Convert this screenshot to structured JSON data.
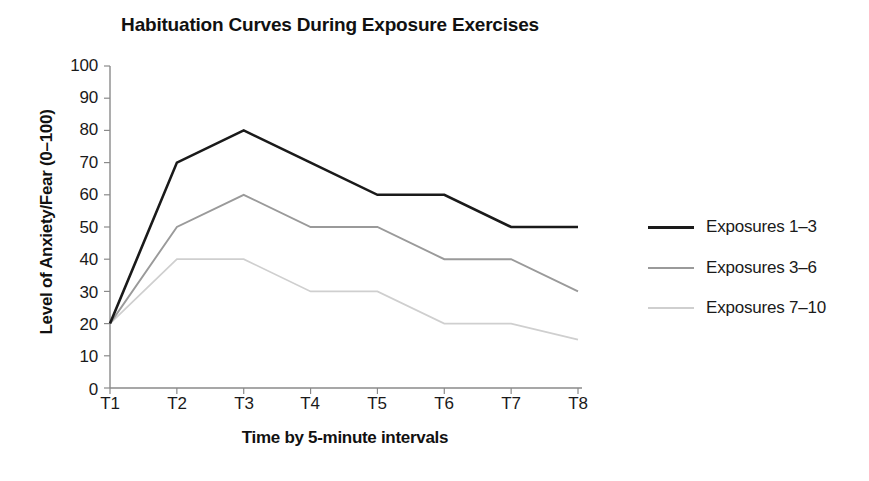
{
  "chart_data": {
    "type": "line",
    "title": "Habituation Curves During Exposure Exercises",
    "xlabel": "Time by 5-minute intervals",
    "ylabel": "Level of Anxiety/Fear (0–100)",
    "categories": [
      "T1",
      "T2",
      "T3",
      "T4",
      "T5",
      "T6",
      "T7",
      "T8"
    ],
    "ylim": [
      0,
      100
    ],
    "yticks": [
      "0",
      "10",
      "20",
      "30",
      "40",
      "50",
      "60",
      "70",
      "80",
      "90",
      "100"
    ],
    "grid": false,
    "legend_position": "right",
    "series": [
      {
        "name": "Exposures 1–3",
        "color": "#1a1a1a",
        "width": 2.6,
        "values": [
          20,
          70,
          80,
          70,
          60,
          60,
          50,
          50
        ]
      },
      {
        "name": "Exposures 3–6",
        "color": "#9a9a9a",
        "width": 1.9,
        "values": [
          20,
          50,
          60,
          50,
          50,
          40,
          40,
          30
        ]
      },
      {
        "name": "Exposures 7–10",
        "color": "#cfcfcf",
        "width": 1.7,
        "values": [
          20,
          40,
          40,
          30,
          30,
          20,
          20,
          15
        ]
      }
    ]
  },
  "axes": {
    "axis_color": "#8a8a8a",
    "tick_color": "#8a8a8a"
  }
}
